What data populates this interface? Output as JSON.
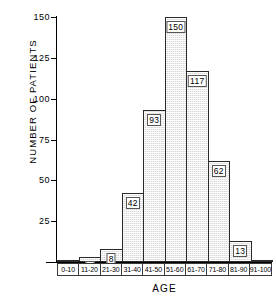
{
  "chart_data": {
    "type": "bar",
    "title": "",
    "xlabel": "AGE",
    "ylabel": "NUMBER OF PATIENTS",
    "categories": [
      "0-10",
      "11-20",
      "21-30",
      "31-40",
      "41-50",
      "51-60",
      "61-70",
      "71-80",
      "81-90",
      "91-100"
    ],
    "values": [
      0,
      3,
      8,
      42,
      93,
      150,
      117,
      62,
      13,
      0
    ],
    "value_labels": [
      "",
      "3",
      "8",
      "42",
      "93",
      "150",
      "117",
      "62",
      "13",
      ""
    ],
    "ylim": [
      0,
      150
    ],
    "xlim_bins": 10,
    "yticks": [
      0,
      25,
      50,
      75,
      100,
      125,
      150
    ],
    "ytick_labels": [
      "",
      "25",
      "50",
      "75",
      "100",
      "125",
      "150"
    ],
    "grid": false,
    "legend": null,
    "bar_fill": "stippled-gray",
    "bar_fill_color": "#d8d8d8",
    "bar_edge_color": "#2a2a2a",
    "axis_color": "#000000",
    "background_color": "#ffffff"
  },
  "axes": {
    "y": {
      "title": "NUMBER OF PATIENTS",
      "ticks": [
        {
          "value": 150,
          "label": "150"
        },
        {
          "value": 125,
          "label": "125"
        },
        {
          "value": 100,
          "label": "100"
        },
        {
          "value": 75,
          "label": "75"
        },
        {
          "value": 50,
          "label": "50"
        },
        {
          "value": 25,
          "label": "25"
        },
        {
          "value": 0,
          "label": ""
        }
      ]
    },
    "x": {
      "title": "AGE",
      "bins": [
        {
          "label": "0-10",
          "count": 0,
          "count_label": ""
        },
        {
          "label": "11-20",
          "count": 3,
          "count_label": "3"
        },
        {
          "label": "21-30",
          "count": 8,
          "count_label": "8"
        },
        {
          "label": "31-40",
          "count": 42,
          "count_label": "42"
        },
        {
          "label": "41-50",
          "count": 93,
          "count_label": "93"
        },
        {
          "label": "51-60",
          "count": 150,
          "count_label": "150"
        },
        {
          "label": "61-70",
          "count": 117,
          "count_label": "117"
        },
        {
          "label": "71-80",
          "count": 62,
          "count_label": "62"
        },
        {
          "label": "81-90",
          "count": 13,
          "count_label": "13"
        },
        {
          "label": "91-100",
          "count": 0,
          "count_label": ""
        }
      ]
    }
  }
}
